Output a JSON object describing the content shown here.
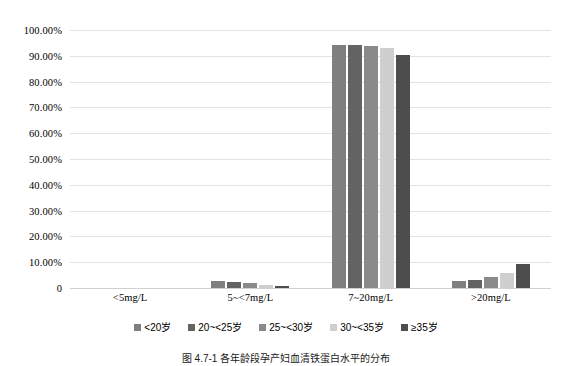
{
  "chart_data": {
    "type": "bar",
    "title": "",
    "xlabel": "",
    "ylabel": "",
    "ylim": [
      0,
      100
    ],
    "grid": true,
    "legend_position": "bottom",
    "categories": [
      "<5mg/L",
      "5~<7mg/L",
      "7~20mg/L",
      ">20mg/L"
    ],
    "y_ticks": [
      "0",
      "10.00%",
      "20.00%",
      "30.00%",
      "40.00%",
      "50.00%",
      "60.00%",
      "70.00%",
      "80.00%",
      "90.00%",
      "100.00%"
    ],
    "y_tick_values": [
      0,
      10,
      20,
      30,
      40,
      50,
      60,
      70,
      80,
      90,
      100
    ],
    "series": [
      {
        "name": "<20岁",
        "color": "#7f7f7f",
        "values": [
          0,
          2.9,
          94.2,
          2.9
        ]
      },
      {
        "name": "20~<25岁",
        "color": "#636363",
        "values": [
          0,
          2.4,
          94.3,
          3.3
        ]
      },
      {
        "name": "25~<30岁",
        "color": "#8a8a8a",
        "values": [
          0,
          1.8,
          93.9,
          4.3
        ]
      },
      {
        "name": "30~<35岁",
        "color": "#cfcfcf",
        "values": [
          0,
          1.0,
          93.1,
          5.9
        ]
      },
      {
        "name": "≥35岁",
        "color": "#4d4d4d",
        "values": [
          0,
          0.6,
          90.2,
          9.2
        ]
      }
    ]
  },
  "caption": {
    "text": "图 4.7-1  各年龄段孕产妇血清铁蛋白水平的分布"
  }
}
